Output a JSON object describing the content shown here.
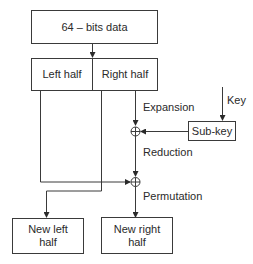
{
  "diagram": {
    "top_box": "64 – bits data",
    "left_half": "Left half",
    "right_half": "Right half",
    "expansion": "Expansion",
    "key": "Key",
    "sub_key": "Sub-key",
    "reduction": "Reduction",
    "permutation": "Permutation",
    "new_left_half": "New left half",
    "new_right_half": "New right half",
    "xor_symbol": "⊕",
    "line_color": "#3a3a3a"
  }
}
